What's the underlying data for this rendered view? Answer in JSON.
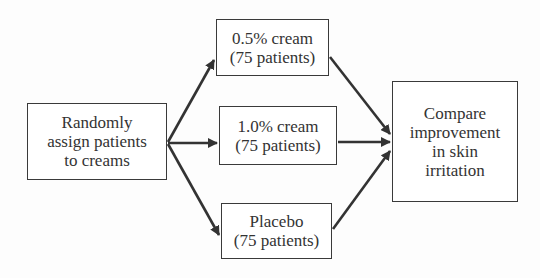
{
  "diagram": {
    "type": "flowchart",
    "nodes": {
      "assign": {
        "lines": [
          "Randomly",
          "assign patients",
          "to creams"
        ]
      },
      "cream05": {
        "lines": [
          "0.5% cream",
          "(75 patients)"
        ]
      },
      "cream10": {
        "lines": [
          "1.0% cream",
          "(75 patients)"
        ]
      },
      "placebo": {
        "lines": [
          "Placebo",
          "(75 patients)"
        ]
      },
      "compare": {
        "lines": [
          "Compare",
          "improvement",
          "in skin",
          "irritation"
        ]
      }
    },
    "edges": [
      {
        "from": "assign",
        "to": "cream05"
      },
      {
        "from": "assign",
        "to": "cream10"
      },
      {
        "from": "assign",
        "to": "placebo"
      },
      {
        "from": "cream05",
        "to": "compare"
      },
      {
        "from": "cream10",
        "to": "compare"
      },
      {
        "from": "placebo",
        "to": "compare"
      }
    ],
    "colors": {
      "line": "#333333",
      "border": "#3a3a3a",
      "text": "#333333",
      "background": "#ffffff"
    }
  }
}
